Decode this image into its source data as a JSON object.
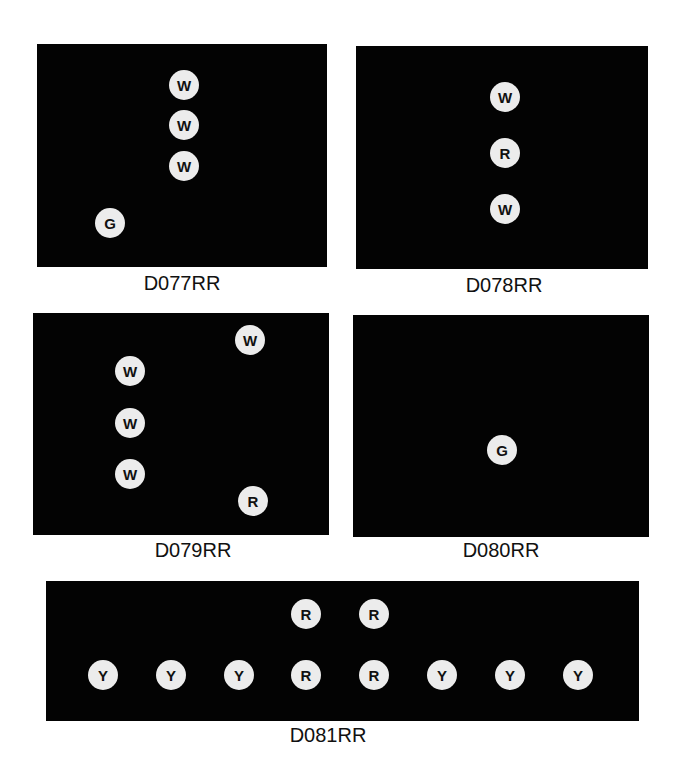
{
  "diagrams": [
    {
      "label": "D077RR",
      "box": [
        37,
        44,
        290,
        223
      ],
      "label_pos": [
        182,
        272
      ],
      "markers": [
        {
          "letter": "W",
          "x": 147,
          "y": 41
        },
        {
          "letter": "W",
          "x": 147,
          "y": 81
        },
        {
          "letter": "W",
          "x": 147,
          "y": 122
        },
        {
          "letter": "G",
          "x": 73,
          "y": 179
        }
      ]
    },
    {
      "label": "D078RR",
      "box": [
        356,
        46,
        292,
        223
      ],
      "label_pos": [
        504,
        274
      ],
      "markers": [
        {
          "letter": "W",
          "x": 149,
          "y": 51
        },
        {
          "letter": "R",
          "x": 149,
          "y": 107
        },
        {
          "letter": "W",
          "x": 149,
          "y": 163
        }
      ]
    },
    {
      "label": "D079RR",
      "box": [
        33,
        313,
        296,
        222
      ],
      "label_pos": [
        193,
        539
      ],
      "markers": [
        {
          "letter": "W",
          "x": 217,
          "y": 27
        },
        {
          "letter": "W",
          "x": 97,
          "y": 58
        },
        {
          "letter": "W",
          "x": 97,
          "y": 110
        },
        {
          "letter": "W",
          "x": 97,
          "y": 161
        },
        {
          "letter": "R",
          "x": 220,
          "y": 188
        }
      ]
    },
    {
      "label": "D080RR",
      "box": [
        353,
        315,
        296,
        222
      ],
      "label_pos": [
        501,
        539
      ],
      "markers": [
        {
          "letter": "G",
          "x": 149,
          "y": 135
        }
      ]
    },
    {
      "label": "D081RR",
      "box": [
        46,
        581,
        593,
        140
      ],
      "label_pos": [
        328,
        724
      ],
      "markers": [
        {
          "letter": "R",
          "x": 260,
          "y": 33
        },
        {
          "letter": "R",
          "x": 328,
          "y": 33
        },
        {
          "letter": "Y",
          "x": 57,
          "y": 94
        },
        {
          "letter": "Y",
          "x": 125,
          "y": 94
        },
        {
          "letter": "Y",
          "x": 193,
          "y": 94
        },
        {
          "letter": "R",
          "x": 260,
          "y": 94
        },
        {
          "letter": "R",
          "x": 328,
          "y": 94
        },
        {
          "letter": "Y",
          "x": 396,
          "y": 94
        },
        {
          "letter": "Y",
          "x": 464,
          "y": 94
        },
        {
          "letter": "Y",
          "x": 532,
          "y": 94
        }
      ]
    }
  ],
  "colors": {
    "panel": "#030303",
    "marker": "#ececec",
    "marker_text": "#111111"
  }
}
